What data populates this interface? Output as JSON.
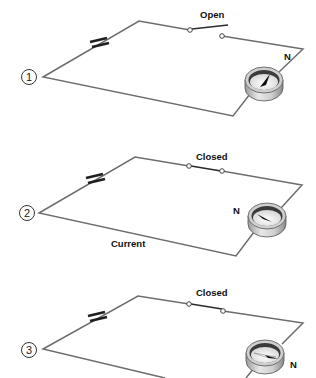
{
  "diagrams": [
    {
      "number": "1",
      "switch_label": "Open",
      "switch_state": "open",
      "north_label": "N",
      "current_label": null
    },
    {
      "number": "2",
      "switch_label": "Closed",
      "switch_state": "closed",
      "north_label": "N",
      "current_label": "Current"
    },
    {
      "number": "3",
      "switch_label": "Closed",
      "switch_state": "closed",
      "north_label": "N",
      "current_label": null
    }
  ],
  "colors": {
    "wire": "#6d6d6d",
    "ink": "#111111",
    "compass_rim": "#d9d9d9",
    "compass_face": "#f4f4f4"
  }
}
